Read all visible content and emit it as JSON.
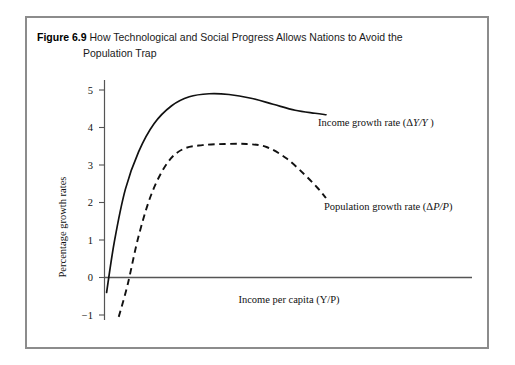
{
  "figure": {
    "label": "Figure 6.9",
    "title_line1": "How Technological and Social Progress Allows Nations to Avoid the",
    "title_line2": "Population Trap",
    "border_color": "#8c8c8c",
    "background": "#ffffff"
  },
  "chart_data": {
    "type": "line",
    "title": "How Technological and Social Progress Allows Nations to Avoid the Population Trap",
    "xlabel": "Income per capita (Y/P)",
    "ylabel": "Percentage growth rates",
    "xlim": [
      0,
      1
    ],
    "ylim": [
      -1,
      5.3
    ],
    "grid": false,
    "legend_position": "inline-annotations",
    "y_ticks": [
      "5",
      "4",
      "3",
      "2",
      "1",
      "0",
      "−1"
    ],
    "y_tick_values": [
      5,
      4,
      3,
      2,
      1,
      0,
      -1
    ],
    "x_ticks": [],
    "zero_line": true,
    "series": [
      {
        "name": "Income growth rate (ΔY/Y )",
        "style": "solid",
        "color": "#111111",
        "label_text_plain": "Income growth rate (",
        "label_text_italic": "Y/Y",
        "label_delta": "Δ",
        "label_tail": " )",
        "annotation_x": 318,
        "annotation_y": 124,
        "x": [
          0.005,
          0.04,
          0.09,
          0.15,
          0.22,
          0.3,
          0.38,
          0.47,
          0.56,
          0.66,
          0.76,
          0.86,
          0.95,
          1.0
        ],
        "y": [
          -0.4,
          0.95,
          2.35,
          3.35,
          4.1,
          4.58,
          4.82,
          4.9,
          4.88,
          4.78,
          4.62,
          4.46,
          4.38,
          4.34
        ]
      },
      {
        "name": "Population growth rate (ΔP/P)",
        "style": "dashed",
        "color": "#111111",
        "label_text_plain": "Population growth rate (",
        "label_text_italic": "P/P",
        "label_delta": "Δ",
        "label_tail": ")",
        "annotation_x": 322,
        "annotation_y": 208,
        "x": [
          0.06,
          0.1,
          0.15,
          0.21,
          0.28,
          0.35,
          0.44,
          0.54,
          0.64,
          0.73,
          0.82,
          0.9,
          0.96,
          1.0
        ],
        "y": [
          -1.05,
          -0.2,
          1.1,
          2.25,
          3.05,
          3.42,
          3.53,
          3.56,
          3.56,
          3.48,
          3.18,
          2.76,
          2.4,
          2.12
        ]
      }
    ]
  },
  "axes": {
    "y_axis_label": "Percentage growth rates",
    "x_axis_label_plain": "Income per capita (",
    "x_axis_label_italic": "Y/P",
    "x_axis_label_tail": ")"
  }
}
